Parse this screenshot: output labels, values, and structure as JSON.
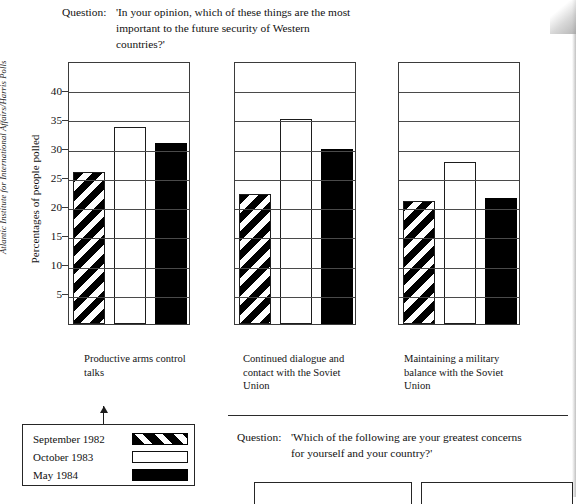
{
  "source_credit": "Atlantic Institute for International Affairs/Harris Polls",
  "question_top": {
    "label": "Question:",
    "lines": [
      "'In your opinion, which of these things are the most",
      "important to the future security of Western",
      "countries?'"
    ]
  },
  "question_bottom": {
    "label": "Question:",
    "lines": [
      "'Which of the following are your greatest concerns",
      "for yourself and your country?'"
    ]
  },
  "legend": {
    "items": [
      {
        "label": "September 1982",
        "pattern": "diagonal-stripes",
        "color": "#000000"
      },
      {
        "label": "October 1983",
        "pattern": "open-white",
        "color": "#ffffff"
      },
      {
        "label": "May 1984",
        "pattern": "solid-black",
        "color": "#000000"
      }
    ]
  },
  "chart_data": {
    "type": "bar",
    "title": "'In your opinion, which of these things are the most important to the future security of Western countries?'",
    "xlabel": "",
    "ylabel": "Percentages of people polled",
    "ylim": [
      0,
      43
    ],
    "yticks": [
      5,
      10,
      15,
      20,
      25,
      30,
      35,
      40
    ],
    "grid": true,
    "legend_position": "below-left",
    "categories": [
      "Productive arms control talks",
      "Continued dialogue and contact with the Soviet Union",
      "Maintaining a military balance with the Soviet Union"
    ],
    "category_lines": [
      [
        "Productive arms control",
        "talks"
      ],
      [
        "Continued dialogue and",
        "contact with the Soviet",
        "Union"
      ],
      [
        "Maintaining a military",
        "balance with the Soviet",
        "Union"
      ]
    ],
    "series": [
      {
        "name": "September 1982",
        "pattern": "diagonal-stripes",
        "values": [
          26.0,
          22.3,
          21.0
        ]
      },
      {
        "name": "October 1983",
        "pattern": "open-white",
        "values": [
          33.7,
          35.0,
          27.7
        ]
      },
      {
        "name": "May 1984",
        "pattern": "solid-black",
        "values": [
          31.0,
          30.0,
          21.5
        ]
      }
    ]
  },
  "axis": {
    "ticks": [
      "40",
      "35",
      "30",
      "25",
      "20",
      "15",
      "10",
      "5"
    ],
    "title": "Percentages of people polled"
  }
}
